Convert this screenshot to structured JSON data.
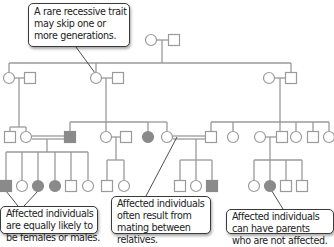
{
  "colors": {
    "line": "#9a9a9a",
    "affected_fill": "#8a8a8a",
    "unaffected_fill": "#ffffff",
    "callout_border": "#3a3a3a",
    "pointer": "#3a3a3a"
  },
  "callouts": {
    "top": {
      "lines": [
        "A rare recessive trait",
        "may skip one or",
        "more generations."
      ]
    },
    "bottom_left": {
      "lines": [
        "Affected individuals",
        "are equally likely to",
        "be females or males."
      ]
    },
    "bottom_middle": {
      "lines": [
        "Affected individuals",
        "often result from",
        "mating between",
        "relatives."
      ]
    },
    "bottom_right": {
      "lines": [
        "Affected individuals",
        "can have parents",
        "who are not affected."
      ]
    }
  },
  "pedigree": {
    "generation_I": [
      {
        "sex": "female",
        "affected": false,
        "x": 151,
        "y": 40
      },
      {
        "sex": "male",
        "affected": false,
        "x": 174,
        "y": 40
      }
    ],
    "generation_II": [
      {
        "sex": "female",
        "affected": false,
        "x": 9,
        "y": 78
      },
      {
        "sex": "male",
        "affected": false,
        "x": 30,
        "y": 78
      },
      {
        "sex": "female",
        "affected": false,
        "x": 96,
        "y": 78
      },
      {
        "sex": "male",
        "affected": false,
        "x": 118,
        "y": 78
      },
      {
        "sex": "female",
        "affected": false,
        "x": 269,
        "y": 78
      },
      {
        "sex": "male",
        "affected": false,
        "x": 291,
        "y": 78
      }
    ],
    "generation_III": [
      {
        "sex": "male",
        "affected": false,
        "x": 10,
        "y": 137
      },
      {
        "sex": "female",
        "affected": false,
        "x": 26,
        "y": 137
      },
      {
        "sex": "male",
        "affected": true,
        "x": 70,
        "y": 137
      },
      {
        "sex": "female",
        "affected": false,
        "x": 106,
        "y": 137
      },
      {
        "sex": "male",
        "affected": false,
        "x": 126,
        "y": 137
      },
      {
        "sex": "female",
        "affected": true,
        "x": 148,
        "y": 137
      },
      {
        "sex": "female",
        "affected": false,
        "x": 167,
        "y": 137
      },
      {
        "sex": "male",
        "affected": false,
        "x": 211,
        "y": 137
      },
      {
        "sex": "female",
        "affected": false,
        "x": 233,
        "y": 137
      },
      {
        "sex": "female",
        "affected": false,
        "x": 260,
        "y": 137
      },
      {
        "sex": "male",
        "affected": false,
        "x": 282,
        "y": 137
      },
      {
        "sex": "female",
        "affected": false,
        "x": 296,
        "y": 137
      },
      {
        "sex": "male",
        "affected": false,
        "x": 313,
        "y": 137
      },
      {
        "sex": "female",
        "affected": false,
        "x": 329,
        "y": 137
      }
    ],
    "generation_IV": [
      {
        "sex": "male",
        "affected": true,
        "x": 6,
        "y": 186
      },
      {
        "sex": "female",
        "affected": false,
        "x": 22,
        "y": 186
      },
      {
        "sex": "female",
        "affected": true,
        "x": 38,
        "y": 186
      },
      {
        "sex": "female",
        "affected": true,
        "x": 55,
        "y": 186
      },
      {
        "sex": "male",
        "affected": false,
        "x": 71,
        "y": 186
      },
      {
        "sex": "female",
        "affected": false,
        "x": 88,
        "y": 186
      },
      {
        "sex": "male",
        "affected": false,
        "x": 107,
        "y": 186
      },
      {
        "sex": "female",
        "affected": false,
        "x": 124,
        "y": 186
      },
      {
        "sex": "male",
        "affected": false,
        "x": 180,
        "y": 186
      },
      {
        "sex": "female",
        "affected": false,
        "x": 196,
        "y": 186
      },
      {
        "sex": "male",
        "affected": true,
        "x": 212,
        "y": 186
      },
      {
        "sex": "female",
        "affected": false,
        "x": 254,
        "y": 186
      },
      {
        "sex": "female",
        "affected": true,
        "x": 270,
        "y": 186
      },
      {
        "sex": "male",
        "affected": false,
        "x": 286,
        "y": 186
      },
      {
        "sex": "male",
        "affected": false,
        "x": 302,
        "y": 186
      }
    ]
  }
}
